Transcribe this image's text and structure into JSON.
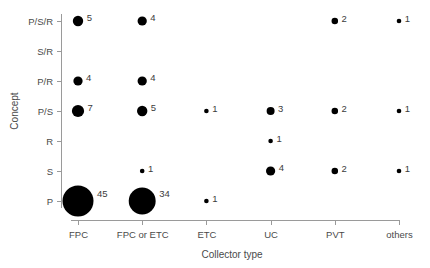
{
  "chart_data": {
    "type": "scatter",
    "title": "",
    "subtitle": "",
    "xlabel": "Collector type",
    "ylabel": "Concept",
    "categories": [
      "FPC",
      "FPC or ETC",
      "ETC",
      "UC",
      "PVT",
      "others"
    ],
    "y_categories": [
      "P",
      "S",
      "R",
      "P/S",
      "P/R",
      "S/R",
      "P/S/R"
    ],
    "y_categories_top_to_bottom": [
      "P/S/R",
      "S/R",
      "P/R",
      "P/S",
      "R",
      "S",
      "P"
    ],
    "grid": false,
    "legend": "none",
    "marker_color": "#000000",
    "bubble_note": "Marker area scales with the count value; each bubble is annotated with its count.",
    "points": [
      {
        "x": "FPC",
        "y": "P/S/R",
        "value": 5,
        "label": "5"
      },
      {
        "x": "FPC or ETC",
        "y": "P/S/R",
        "value": 4,
        "label": "4"
      },
      {
        "x": "PVT",
        "y": "P/S/R",
        "value": 2,
        "label": "2"
      },
      {
        "x": "others",
        "y": "P/S/R",
        "value": 1,
        "label": "1"
      },
      {
        "x": "FPC",
        "y": "P/R",
        "value": 4,
        "label": "4"
      },
      {
        "x": "FPC or ETC",
        "y": "P/R",
        "value": 4,
        "label": "4"
      },
      {
        "x": "FPC",
        "y": "P/S",
        "value": 7,
        "label": "7"
      },
      {
        "x": "FPC or ETC",
        "y": "P/S",
        "value": 5,
        "label": "5"
      },
      {
        "x": "ETC",
        "y": "P/S",
        "value": 1,
        "label": "1"
      },
      {
        "x": "UC",
        "y": "P/S",
        "value": 3,
        "label": "3"
      },
      {
        "x": "PVT",
        "y": "P/S",
        "value": 2,
        "label": "2"
      },
      {
        "x": "others",
        "y": "P/S",
        "value": 1,
        "label": "1"
      },
      {
        "x": "UC",
        "y": "R",
        "value": 1,
        "label": "1"
      },
      {
        "x": "FPC or ETC",
        "y": "S",
        "value": 1,
        "label": "1"
      },
      {
        "x": "UC",
        "y": "S",
        "value": 4,
        "label": "4"
      },
      {
        "x": "PVT",
        "y": "S",
        "value": 2,
        "label": "2"
      },
      {
        "x": "others",
        "y": "S",
        "value": 1,
        "label": "1"
      },
      {
        "x": "FPC",
        "y": "P",
        "value": 45,
        "label": "45"
      },
      {
        "x": "FPC or ETC",
        "y": "P",
        "value": 34,
        "label": "34"
      },
      {
        "x": "ETC",
        "y": "P",
        "value": 1,
        "label": "1"
      }
    ],
    "empty_rows": [
      "S/R"
    ]
  },
  "axes": {
    "x_tick_labels": [
      "FPC",
      "FPC or ETC",
      "ETC",
      "UC",
      "PVT",
      "others"
    ],
    "y_tick_labels": [
      "P/S/R",
      "S/R",
      "P/R",
      "P/S",
      "R",
      "S",
      "P"
    ],
    "x_title": "Collector type",
    "y_title": "Concept",
    "axis_color": "#9a9a9a",
    "tick_label_color": "#4a4a4a"
  }
}
